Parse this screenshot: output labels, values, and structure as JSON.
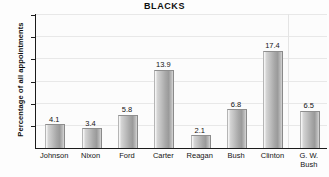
{
  "chart_data": {
    "type": "bar",
    "title": "BLACKS",
    "xlabel": "",
    "ylabel": "Percentage of all appointments",
    "categories": [
      "Johnson",
      "Nixon",
      "Ford",
      "Carter",
      "Reagan",
      "Bush",
      "Clinton",
      "G. W.\nBush"
    ],
    "values": [
      4.1,
      3.4,
      5.8,
      13.9,
      2.1,
      6.8,
      17.4,
      6.5
    ],
    "value_labels": [
      "4.1",
      "3.4",
      "5.8",
      "13.9",
      "2.1",
      "6.8",
      "17.4",
      "6.5"
    ],
    "ylim": [
      0,
      24
    ],
    "yticks": [
      4,
      8,
      12,
      16,
      20,
      24
    ],
    "ytick_labels": [
      "4",
      "8",
      "12",
      "16",
      "20",
      "24"
    ],
    "grid": true,
    "legend": false,
    "bar_color": "#b0b0b0",
    "axis_color": "#1b1b1b",
    "gridline_color": "#e8e8e8",
    "background_color": "#fcfcfc"
  }
}
